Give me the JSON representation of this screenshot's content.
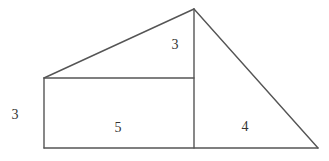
{
  "diagram": {
    "type": "geometric-figure",
    "stroke_color": "#555555",
    "points": {
      "apex": [
        194,
        9
      ],
      "rect_top_left": [
        44,
        78
      ],
      "rect_top_right": [
        194,
        78
      ],
      "rect_bottom_left": [
        44,
        148
      ],
      "rect_bottom_right": [
        194,
        148
      ],
      "right_tip": [
        318,
        148
      ]
    },
    "labels": {
      "top_triangle_height": "3",
      "rect_height": "3",
      "rect_width": "5",
      "right_triangle_base": "4"
    },
    "label_positions": {
      "top_triangle_height": [
        175,
        46
      ],
      "rect_height": [
        15,
        116
      ],
      "rect_width": [
        118,
        129
      ],
      "right_triangle_base": [
        245,
        128
      ]
    }
  }
}
